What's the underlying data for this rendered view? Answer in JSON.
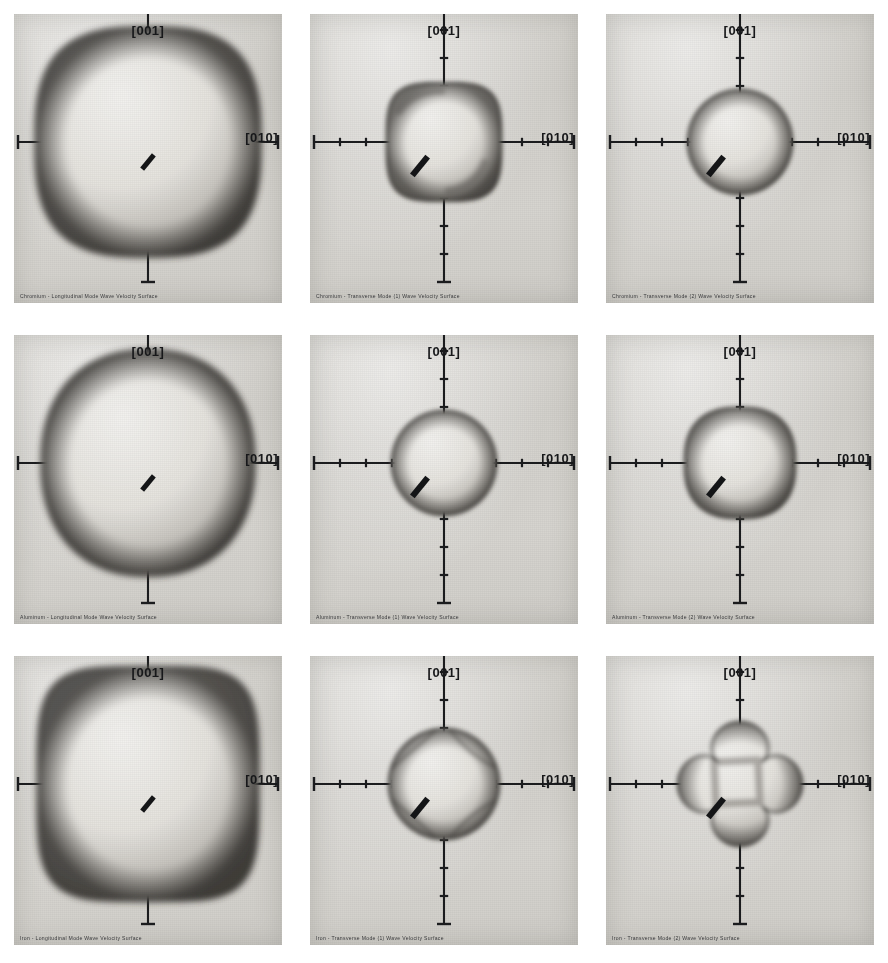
{
  "figure": {
    "layout": {
      "rows": 3,
      "cols": 3
    },
    "axis_labels": {
      "vertical": "[001]",
      "horizontal": "[010]"
    },
    "materials": [
      "Chromium",
      "Aluminum",
      "Iron"
    ],
    "modes": [
      "Longitudinal Mode",
      "Transverse Mode (1)",
      "Transverse Mode (2)"
    ]
  },
  "panels": [
    {
      "id": "chromium-longitudinal",
      "material": "Chromium",
      "mode": "Longitudinal Mode",
      "caption": "Chromium - Longitudinal Mode Wave Velocity Surface",
      "label_up": "[001]",
      "label_right": "[010]",
      "shape": "large-squircle",
      "radius_fraction": 0.86,
      "axis_ticks_per_arm": 1,
      "scalebar": true
    },
    {
      "id": "chromium-transverse-1",
      "material": "Chromium",
      "mode": "Transverse Mode (1)",
      "caption": "Chromium - Transverse Mode (1) Wave Velocity Surface",
      "label_up": "[001]",
      "label_right": "[010]",
      "shape": "rounded-square",
      "radius_fraction": 0.42,
      "axis_ticks_per_arm": 4,
      "scalebar": true
    },
    {
      "id": "chromium-transverse-2",
      "material": "Chromium",
      "mode": "Transverse Mode (2)",
      "caption": "Chromium - Transverse Mode (2) Wave Velocity Surface",
      "label_up": "[001]",
      "label_right": "[010]",
      "shape": "sphere",
      "radius_fraction": 0.4,
      "axis_ticks_per_arm": 4,
      "scalebar": true
    },
    {
      "id": "aluminum-longitudinal",
      "material": "Aluminum",
      "mode": "Longitudinal Mode",
      "caption": "Aluminum - Longitudinal Mode Wave Velocity Surface",
      "label_up": "[001]",
      "label_right": "[010]",
      "shape": "large-sphere",
      "radius_fraction": 0.8,
      "axis_ticks_per_arm": 1,
      "scalebar": true
    },
    {
      "id": "aluminum-transverse-1",
      "material": "Aluminum",
      "mode": "Transverse Mode (1)",
      "caption": "Aluminum - Transverse Mode (1) Wave Velocity Surface",
      "label_up": "[001]",
      "label_right": "[010]",
      "shape": "sphere",
      "radius_fraction": 0.35,
      "axis_ticks_per_arm": 4,
      "scalebar": true
    },
    {
      "id": "aluminum-transverse-2",
      "material": "Aluminum",
      "mode": "Transverse Mode (2)",
      "caption": "Aluminum - Transverse Mode (2) Wave Velocity Surface",
      "label_up": "[001]",
      "label_right": "[010]",
      "shape": "rounded-diamond",
      "radius_fraction": 0.38,
      "axis_ticks_per_arm": 4,
      "scalebar": true
    },
    {
      "id": "iron-longitudinal",
      "material": "Iron",
      "mode": "Longitudinal Mode",
      "caption": "Iron - Longitudinal Mode Wave Velocity Surface",
      "label_up": "[001]",
      "label_right": "[010]",
      "shape": "large-rounded-square",
      "radius_fraction": 0.84,
      "axis_ticks_per_arm": 2,
      "scalebar": true
    },
    {
      "id": "iron-transverse-1",
      "material": "Iron",
      "mode": "Transverse Mode (1)",
      "caption": "Iron - Transverse Mode (1) Wave Velocity Surface",
      "label_up": "[001]",
      "label_right": "[010]",
      "shape": "creased-sphere",
      "radius_fraction": 0.4,
      "axis_ticks_per_arm": 4,
      "scalebar": true
    },
    {
      "id": "iron-transverse-2",
      "material": "Iron",
      "mode": "Transverse Mode (2)",
      "caption": "Iron - Transverse Mode (2) Wave Velocity Surface",
      "label_up": "[001]",
      "label_right": "[010]",
      "shape": "four-point-star",
      "radius_fraction": 0.42,
      "axis_ticks_per_arm": 4,
      "scalebar": true
    }
  ]
}
